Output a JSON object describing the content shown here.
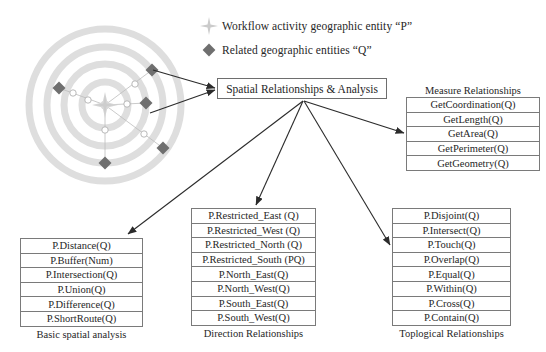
{
  "legend": {
    "items": [
      {
        "marker": "star-four-point-icon",
        "color": "#c9c9c9",
        "label": "Workflow activity geographic entity “P”"
      },
      {
        "marker": "diamond-icon",
        "color": "#6f6f6f",
        "label": "Related geographic entities “Q”"
      }
    ]
  },
  "center": {
    "label": "Spatial Relationships & Analysis"
  },
  "groups": {
    "measure": {
      "title": "Measure Relationships",
      "title_position": "above",
      "rows": [
        "GetCoordination(Q)",
        "GetLength(Q)",
        "GetArea(Q)",
        "GetPerimeter(Q)",
        "GetGeometry(Q)"
      ]
    },
    "basic": {
      "title": "Basic spatial analysis",
      "title_position": "below",
      "rows": [
        "P.Distance(Q)",
        "P.Buffer(Num)",
        "P.Intersection(Q)",
        "P.Union(Q)",
        "P.Difference(Q)",
        "P.ShortRoute(Q)"
      ]
    },
    "direction": {
      "title": "Direction Relationships",
      "title_position": "below",
      "rows": [
        "P.Restricted_East (Q)",
        "P.Restricted_West (Q)",
        "P.Restricted_North (Q)",
        "P.Restricted_South (PQ)",
        "P.North_East(Q)",
        "P.North_West(Q)",
        "P.South_East(Q)",
        "P.South_West(Q)"
      ]
    },
    "topological": {
      "title": "Toplogical Relationships",
      "title_position": "below",
      "rows": [
        "P.Disjoint(Q)",
        "P.Intersect(Q)",
        "P.Touch(Q)",
        "P.Overlap(Q)",
        "P.Equal(Q)",
        "P.Within(Q)",
        "P.Cross(Q)",
        "P.Contain(Q)"
      ]
    }
  },
  "ring_diagram": {
    "ring_count": 4,
    "ring_color": "#dcdcdc",
    "center_marker": "star-four-point-icon",
    "center_marker_color": "#d2d2d2",
    "related_marker": "diamond-icon",
    "related_marker_color": "#6f6f6f",
    "related_marker_count": 5,
    "connector_color": "#b5b5b5"
  },
  "colors": {
    "line": "#2b2b2b",
    "box_border": "#7a7a7a",
    "text": "#262626",
    "ring": "#dcdcdc",
    "diamond": "#6f6f6f",
    "star": "#d2d2d2"
  }
}
